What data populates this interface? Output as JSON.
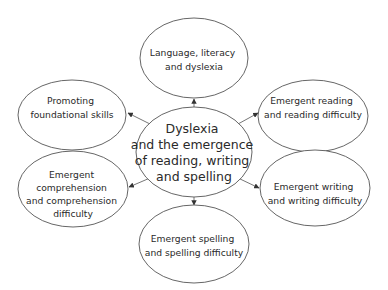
{
  "diagram": {
    "type": "hub-and-spoke concept map",
    "center": {
      "lines": [
        "Dyslexia",
        "and the emergence",
        "of reading, writing",
        "and spelling"
      ]
    },
    "nodes": [
      {
        "id": "top",
        "lines": [
          "Language, literacy",
          "and dyslexia"
        ]
      },
      {
        "id": "upper-left",
        "lines": [
          "Promoting",
          "foundational skills"
        ]
      },
      {
        "id": "upper-right",
        "lines": [
          "Emergent reading",
          "and reading difficulty"
        ]
      },
      {
        "id": "lower-left",
        "lines": [
          "Emergent",
          "comprehension",
          "and comprehension",
          "difficulty"
        ]
      },
      {
        "id": "lower-right",
        "lines": [
          "Emergent writing",
          "and writing difficulty"
        ]
      },
      {
        "id": "bottom",
        "lines": [
          "Emergent spelling",
          "and spelling difficulty"
        ]
      }
    ],
    "edges": [
      {
        "from": "center",
        "to": "top"
      },
      {
        "from": "center",
        "to": "upper-left"
      },
      {
        "from": "center",
        "to": "upper-right"
      },
      {
        "from": "center",
        "to": "lower-left"
      },
      {
        "from": "center",
        "to": "lower-right"
      },
      {
        "from": "center",
        "to": "bottom"
      }
    ],
    "colors": {
      "stroke": "#555555",
      "text": "#2a2a2a",
      "background": "#ffffff"
    }
  }
}
